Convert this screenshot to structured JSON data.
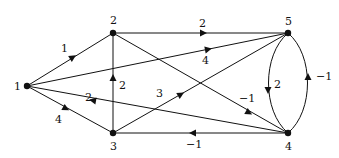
{
  "diagram": {
    "type": "directed-weighted-graph",
    "nodes": [
      {
        "id": "1",
        "label": "1"
      },
      {
        "id": "2",
        "label": "2"
      },
      {
        "id": "3",
        "label": "3"
      },
      {
        "id": "4",
        "label": "4"
      },
      {
        "id": "5",
        "label": "5"
      }
    ],
    "edges": [
      {
        "from": "1",
        "to": "2",
        "weight": "1"
      },
      {
        "from": "1",
        "to": "5",
        "weight": "4"
      },
      {
        "from": "1",
        "to": "3",
        "weight": "4"
      },
      {
        "from": "4",
        "to": "1",
        "weight": "2"
      },
      {
        "from": "3",
        "to": "2",
        "weight": "2"
      },
      {
        "from": "2",
        "to": "5",
        "weight": "2"
      },
      {
        "from": "2",
        "to": "4",
        "weight": "−1"
      },
      {
        "from": "3",
        "to": "5",
        "weight": "3"
      },
      {
        "from": "4",
        "to": "3",
        "weight": "−1"
      },
      {
        "from": "5",
        "to": "4",
        "weight": "2"
      },
      {
        "from": "4",
        "to": "5",
        "weight": "−1"
      }
    ]
  }
}
